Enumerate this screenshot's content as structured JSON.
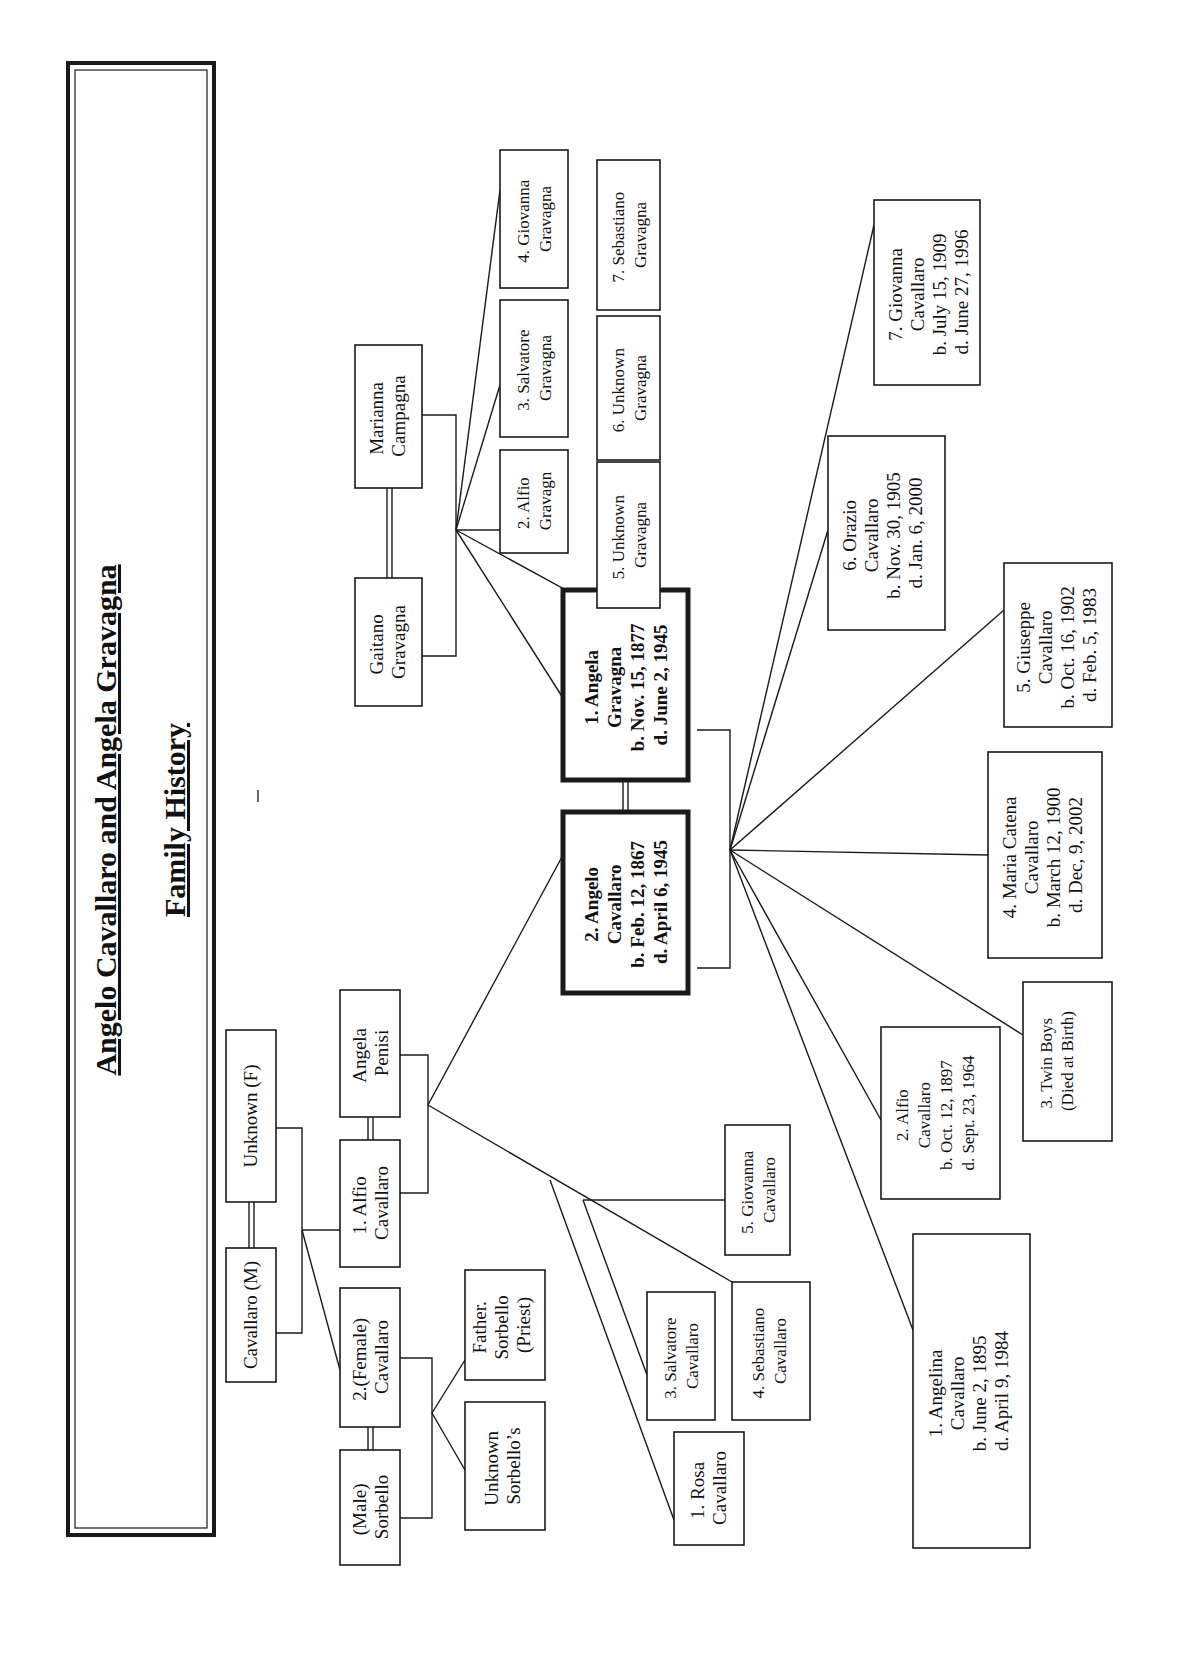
{
  "title": {
    "line1": "Angelo Cavallaro and Angela Gravagna",
    "line2": "Family History"
  },
  "grandparents_paternal": {
    "father": "Cavallaro (M)",
    "mother": "Unknown (F)"
  },
  "paternal_children": [
    {
      "lines": [
        "1. Alfio",
        "Cavallaro"
      ]
    },
    {
      "lines": [
        "2.(Female)",
        "Cavallaro"
      ]
    }
  ],
  "alfio_spouse": {
    "lines": [
      "Angela",
      "Penisi"
    ]
  },
  "female_cavallaro_spouse": {
    "lines": [
      "(Male)",
      "Sorbello"
    ]
  },
  "sorbello_children": [
    {
      "lines": [
        "Father.",
        "Sorbello",
        "(Priest)"
      ]
    },
    {
      "lines": [
        "Unknown",
        "Sorbello’s"
      ]
    }
  ],
  "alfio_children": [
    {
      "lines": [
        "1. Rosa",
        "Cavallaro"
      ]
    },
    {
      "lines": [
        "3. Salvatore",
        "Cavallaro"
      ]
    },
    {
      "lines": [
        "4. Sebastiano",
        "Cavallaro"
      ]
    },
    {
      "lines": [
        "5. Giovanna",
        "Cavallaro"
      ]
    }
  ],
  "grandparents_maternal": {
    "father": {
      "lines": [
        "Gaitano",
        "Gravagna"
      ]
    },
    "mother": {
      "lines": [
        "Marianna",
        "Campagna"
      ]
    }
  },
  "gravagna_children": [
    {
      "lines": [
        "2. Alfio",
        "Gravagn"
      ]
    },
    {
      "lines": [
        "3. Salvatore",
        "Gravagna"
      ]
    },
    {
      "lines": [
        "4. Giovanna",
        "Gravagna"
      ]
    },
    {
      "lines": [
        "5. Unknown",
        "Gravagna"
      ]
    },
    {
      "lines": [
        "6. Unknown",
        "Gravagna"
      ]
    },
    {
      "lines": [
        "7. Sebastiano",
        "Gravagna"
      ]
    }
  ],
  "couple": {
    "husband": {
      "lines": [
        "2. Angelo",
        "Cavallaro",
        "b. Feb. 12, 1867",
        "d. April 6, 1945"
      ]
    },
    "wife": {
      "lines": [
        "1. Angela",
        "Gravagna",
        "b. Nov. 15, 1877",
        "d. June 2, 1945"
      ]
    }
  },
  "children": [
    {
      "lines": [
        "1. Angelina",
        "Cavallaro",
        "b. June 2, 1895",
        "d. April 9, 1984"
      ]
    },
    {
      "lines": [
        "2. Alfio",
        "Cavallaro",
        "b. Oct. 12, 1897",
        "d. Sept. 23, 1964"
      ]
    },
    {
      "lines": [
        "3. Twin Boys",
        "(Died at Birth)"
      ]
    },
    {
      "lines": [
        "4. Maria Catena",
        "Cavallaro",
        "b. March 12, 1900",
        "d. Dec, 9, 2002"
      ]
    },
    {
      "lines": [
        "5. Giuseppe",
        "Cavallaro",
        "b. Oct. 16, 1902",
        "d. Feb. 5, 1983"
      ]
    },
    {
      "lines": [
        "6. Orazio",
        "Cavallaro",
        "b. Nov. 30, 1905",
        "d. Jan. 6, 2000"
      ]
    },
    {
      "lines": [
        "7. Giovanna",
        "Cavallaro",
        "b. July 15, 1909",
        "d. June 27, 1996"
      ]
    }
  ]
}
